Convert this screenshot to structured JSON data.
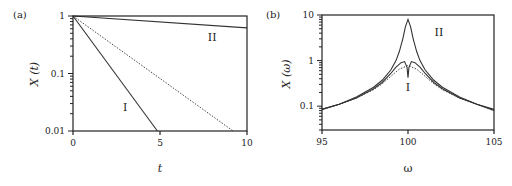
{
  "chart_data": [
    {
      "panel": "(a)",
      "type": "line",
      "xlabel": "t",
      "ylabel": "X (t)",
      "xscale": "linear",
      "yscale": "log",
      "xlim": [
        0,
        10
      ],
      "ylim": [
        0.01,
        1
      ],
      "xticks": [
        0,
        5,
        10
      ],
      "xtick_labels": [
        "0",
        "5",
        "10"
      ],
      "yticks": [
        0.01,
        0.1,
        1
      ],
      "ytick_labels": [
        "0.01",
        "0.1",
        "1"
      ],
      "grid": false,
      "legend": null,
      "series": [
        {
          "name": "I",
          "style": "solid",
          "x": [
            0,
            4.85
          ],
          "y": [
            1,
            0.01
          ]
        },
        {
          "name": "dotted",
          "style": "dotted",
          "x": [
            0,
            9.2
          ],
          "y": [
            1,
            0.01
          ]
        },
        {
          "name": "II",
          "style": "solid",
          "x": [
            0,
            10
          ],
          "y": [
            1,
            0.62
          ]
        }
      ],
      "annotations": [
        {
          "text": "I",
          "x": 3.0,
          "y": 0.022
        },
        {
          "text": "II",
          "x": 8.0,
          "y": 0.37
        }
      ]
    },
    {
      "panel": "(b)",
      "type": "line",
      "xlabel": "ω",
      "ylabel": "X (ω)",
      "xscale": "linear",
      "yscale": "log",
      "xlim": [
        95,
        105
      ],
      "ylim": [
        0.03,
        10
      ],
      "xticks": [
        95,
        100,
        105
      ],
      "xtick_labels": [
        "95",
        "100",
        "105"
      ],
      "yticks": [
        0.1,
        1,
        10
      ],
      "ytick_labels": [
        "0.1",
        "1",
        "10"
      ],
      "grid": false,
      "legend": null,
      "series": [
        {
          "name": "II",
          "style": "solid",
          "x": [
            95,
            96,
            97,
            98,
            98.5,
            99,
            99.3,
            99.5,
            99.7,
            99.85,
            100,
            100.15,
            100.3,
            100.5,
            100.7,
            101,
            101.5,
            102,
            103,
            104,
            105
          ],
          "y": [
            0.085,
            0.11,
            0.16,
            0.26,
            0.37,
            0.62,
            1.0,
            1.6,
            3.0,
            5.5,
            8.0,
            5.5,
            3.0,
            1.6,
            1.0,
            0.62,
            0.37,
            0.26,
            0.16,
            0.11,
            0.085
          ]
        },
        {
          "name": "I",
          "style": "solid",
          "x": [
            95,
            96,
            97,
            98,
            98.5,
            99,
            99.3,
            99.6,
            99.8,
            99.95,
            100,
            100.05,
            100.2,
            100.4,
            100.7,
            101,
            101.5,
            102,
            103,
            104,
            105
          ],
          "y": [
            0.085,
            0.11,
            0.15,
            0.24,
            0.33,
            0.52,
            0.72,
            0.9,
            0.95,
            0.7,
            0.42,
            0.7,
            0.95,
            0.9,
            0.72,
            0.52,
            0.33,
            0.24,
            0.15,
            0.11,
            0.08
          ]
        },
        {
          "name": "dotted",
          "style": "dotted",
          "x": [
            95,
            96,
            97,
            98,
            98.5,
            99,
            99.5,
            100,
            100.5,
            101,
            101.5,
            102,
            103,
            104,
            105
          ],
          "y": [
            0.085,
            0.11,
            0.15,
            0.23,
            0.31,
            0.45,
            0.65,
            0.78,
            0.65,
            0.45,
            0.31,
            0.23,
            0.15,
            0.11,
            0.08
          ]
        }
      ],
      "annotations": [
        {
          "text": "II",
          "x": 101.8,
          "y": 3.5
        },
        {
          "text": "I",
          "x": 100.0,
          "y": 0.22
        }
      ]
    }
  ],
  "panels": [
    {
      "label": "(a)",
      "xlabel": "t",
      "ylabel": "X (t)"
    },
    {
      "label": "(b)",
      "xlabel": "ω",
      "ylabel": "X (ω)"
    }
  ]
}
